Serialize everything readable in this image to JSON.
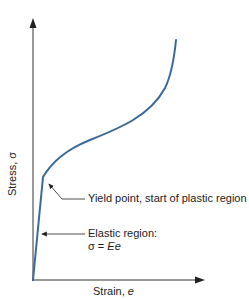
{
  "header": {
    "cropped_text": "p... ... ... ... ...g... ..."
  },
  "diagram": {
    "type": "stress-strain curve",
    "y_axis_label": "Stress, σ",
    "x_axis_label_prefix": "Strain, ",
    "x_axis_label_var": "e",
    "annotations": [
      {
        "id": "yield",
        "text": "Yield point, start of plastic region"
      },
      {
        "id": "elastic",
        "line1": "Elastic region:",
        "line2_prefix": "σ = ",
        "line2_var": "Ee"
      }
    ],
    "colors": {
      "curve": "#3a6a9a",
      "axes": "#333333",
      "text": "#222222"
    }
  }
}
